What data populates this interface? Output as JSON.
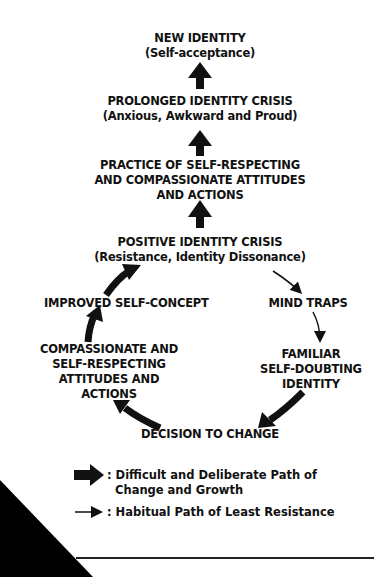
{
  "diagram": {
    "nodes": {
      "new_identity": {
        "title": "NEW IDENTITY",
        "subtitle": "(Self-acceptance)"
      },
      "prolonged_crisis": {
        "title": "PROLONGED IDENTITY CRISIS",
        "subtitle": "(Anxious, Awkward and Proud)"
      },
      "practice": {
        "line1": "PRACTICE OF SELF-RESPECTING",
        "line2": "AND COMPASSIONATE ATTITUDES",
        "line3": "AND ACTIONS"
      },
      "positive_crisis": {
        "title": "POSITIVE IDENTITY CRISIS",
        "subtitle": "(Resistance, Identity Dissonance)"
      },
      "improved_self_concept": {
        "title": "IMPROVED SELF-CONCEPT"
      },
      "mind_traps": {
        "title": "MIND TRAPS"
      },
      "compassionate": {
        "line1": "COMPASSIONATE AND",
        "line2": "SELF-RESPECTING",
        "line3": "ATTITUDES AND",
        "line4": "ACTIONS"
      },
      "familiar": {
        "line1": "FAMILIAR",
        "line2": "SELF-DOUBTING",
        "line3": "IDENTITY"
      },
      "decision": {
        "title": "DECISION TO CHANGE"
      }
    },
    "edges": [
      {
        "from": "prolonged_crisis",
        "to": "new_identity",
        "style": "thick"
      },
      {
        "from": "practice",
        "to": "prolonged_crisis",
        "style": "thick"
      },
      {
        "from": "positive_crisis",
        "to": "practice",
        "style": "thick"
      },
      {
        "from": "improved_self_concept",
        "to": "positive_crisis",
        "style": "thick"
      },
      {
        "from": "compassionate",
        "to": "improved_self_concept",
        "style": "thick"
      },
      {
        "from": "decision",
        "to": "compassionate",
        "style": "thick"
      },
      {
        "from": "familiar",
        "to": "decision",
        "style": "thick"
      },
      {
        "from": "positive_crisis",
        "to": "mind_traps",
        "style": "thin"
      },
      {
        "from": "mind_traps",
        "to": "familiar",
        "style": "thin"
      }
    ],
    "legend": {
      "thick_line1": ": Difficult and Deliberate Path of",
      "thick_line2": "Change and Growth",
      "thin": ": Habitual Path of Least Resistance"
    },
    "colors": {
      "ink": "#111111",
      "background": "#ffffff"
    }
  }
}
